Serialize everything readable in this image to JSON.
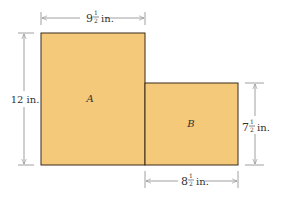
{
  "figure": {
    "fill_color": "#f5c97a",
    "stroke_color": "#3a2a1a",
    "dim_line_color": "#888888",
    "shapes": [
      {
        "id": "A",
        "label": "A"
      },
      {
        "id": "B",
        "label": "B"
      }
    ],
    "dimensions": {
      "top_width": {
        "whole": "9",
        "num": "1",
        "den": "2",
        "unit": "in."
      },
      "left_height": {
        "text": "12 in."
      },
      "right_height": {
        "whole": "7",
        "num": "1",
        "den": "2",
        "unit": "in."
      },
      "bottom_width": {
        "whole": "8",
        "num": "1",
        "den": "2",
        "unit": "in."
      }
    }
  }
}
